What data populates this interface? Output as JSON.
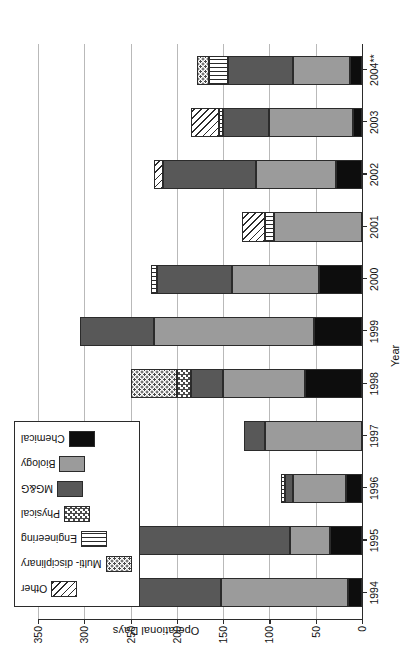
{
  "chart_data": {
    "type": "bar",
    "subtype": "stacked-bar",
    "title": "",
    "xlabel": "Year",
    "ylabel": "Operational Days",
    "ylim": [
      0,
      350
    ],
    "ytick_step": 50,
    "yticks": [
      0,
      50,
      100,
      150,
      200,
      250,
      300,
      350
    ],
    "grid": true,
    "grid_axis": "y",
    "legend_position": "top-left",
    "orientation": "rotated-90-clockwise",
    "categories": [
      "1994",
      "1995",
      "1996",
      "1997",
      "1998",
      "1999",
      "2000",
      "2001",
      "2002",
      "2003",
      "2004**"
    ],
    "series": [
      {
        "name": "Chemical",
        "key": "chemical",
        "pattern": "solid-black",
        "color": "#0d0d0d",
        "values": [
          15,
          35,
          17,
          0,
          62,
          52,
          47,
          0,
          28,
          10,
          13
        ]
      },
      {
        "name": "Biology",
        "key": "biology",
        "pattern": "solid-mid-gray",
        "color": "#9b9b9b",
        "values": [
          137,
          43,
          58,
          105,
          88,
          173,
          93,
          95,
          87,
          90,
          62
        ]
      },
      {
        "name": "MG&G",
        "key": "mgg",
        "pattern": "solid-dark-gray",
        "color": "#585858",
        "values": [
          113,
          200,
          8,
          23,
          35,
          80,
          82,
          0,
          100,
          50,
          70
        ]
      },
      {
        "name": "Physical",
        "key": "physical",
        "pattern": "checkerboard",
        "color": "#4a4a4a",
        "values": [
          0,
          0,
          0,
          0,
          15,
          0,
          0,
          0,
          0,
          0,
          0
        ]
      },
      {
        "name": "Engineering",
        "key": "engineering",
        "pattern": "vertical-lines",
        "color": "#2b2b2b",
        "values": [
          15,
          4,
          4,
          0,
          0,
          0,
          6,
          10,
          0,
          5,
          20
        ]
      },
      {
        "name": "Multi- disciplinary",
        "key": "multi",
        "pattern": "dotted",
        "color": "#4a4a4a",
        "values": [
          0,
          0,
          0,
          0,
          50,
          0,
          0,
          0,
          0,
          0,
          13
        ]
      },
      {
        "name": "Other",
        "key": "other",
        "pattern": "diagonal-hatch",
        "color": "#2b2b2b",
        "values": [
          0,
          0,
          0,
          0,
          0,
          0,
          0,
          25,
          10,
          30,
          0
        ]
      }
    ],
    "totals": [
      280,
      282,
      87,
      128,
      250,
      305,
      228,
      130,
      225,
      185,
      178
    ],
    "stack_order_from_zero": [
      "chemical",
      "biology",
      "mgg",
      "physical",
      "engineering",
      "multi",
      "other"
    ]
  },
  "legend": {
    "items": [
      {
        "label": "Other"
      },
      {
        "label": "Multi- disciplinary"
      },
      {
        "label": "Engineering"
      },
      {
        "label": "Physical"
      },
      {
        "label": "MG&G"
      },
      {
        "label": "Biology"
      },
      {
        "label": "Chemical"
      }
    ]
  }
}
